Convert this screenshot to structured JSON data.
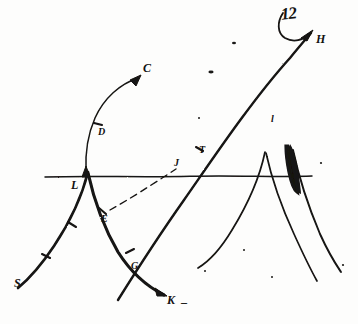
{
  "figure": {
    "kind": "hand-drawn-sketch",
    "medium": "black ink on white paper",
    "background_color": "#fdfdfc",
    "ink_color": "#141312",
    "width": 358,
    "height": 324
  },
  "annotations": {
    "top_right_note": "12"
  },
  "labels": [
    {
      "id": "C",
      "text": "C",
      "x": 143,
      "y": 62,
      "size": "lbl-md",
      "note": "terminus of upward arrow from left branch"
    },
    {
      "id": "H",
      "text": "H",
      "x": 316,
      "y": 33,
      "size": "lbl-md",
      "note": "terminus of long rising ray, upper right"
    },
    {
      "id": "D",
      "text": "D",
      "x": 98,
      "y": 127,
      "size": "lbl-sm",
      "note": "tick/label on ascending left branch"
    },
    {
      "id": "T",
      "text": "T",
      "x": 199,
      "y": 145,
      "size": "lbl-sm",
      "note": "mark above the crossing point"
    },
    {
      "id": "J",
      "text": "J",
      "x": 174,
      "y": 158,
      "size": "lbl-sm",
      "note": "mark at the line crossing on the datum"
    },
    {
      "id": "L",
      "text": "L",
      "x": 71,
      "y": 179,
      "size": "lbl-md",
      "note": "cusp apex on the horizontal datum line"
    },
    {
      "id": "l",
      "text": "l",
      "x": 271,
      "y": 114,
      "size": "lbl-sm",
      "note": "small stroke right of centre"
    },
    {
      "id": "E",
      "text": "E",
      "x": 101,
      "y": 214,
      "size": "lbl-sm",
      "note": "foot of the dashed connector"
    },
    {
      "id": "G",
      "text": "G",
      "x": 131,
      "y": 261,
      "size": "lbl-sm",
      "note": "label on descending main curve"
    },
    {
      "id": "S",
      "text": "S",
      "x": 14,
      "y": 277,
      "size": "lbl-md",
      "note": "lower-left terminus of the caustic curve"
    },
    {
      "id": "K",
      "text": "K",
      "x": 167,
      "y": 294,
      "size": "lbl-md",
      "note": "lower terminus, arrowhead points to it"
    },
    {
      "id": "Kdash",
      "text": "_",
      "x": 181,
      "y": 294,
      "size": "lbl-md",
      "note": "short dash following K"
    }
  ],
  "curves": [
    {
      "name": "datum-line",
      "role": "horizontal reference axis",
      "from": [
        45,
        177
      ],
      "to": [
        312,
        176
      ]
    },
    {
      "name": "left-caustic-lower",
      "role": "cusp branch descending to S",
      "from": [
        88,
        172
      ],
      "to": [
        18,
        288
      ]
    },
    {
      "name": "left-caustic-main",
      "role": "cusp branch descending to K",
      "from": [
        88,
        172
      ],
      "to": [
        165,
        295
      ]
    },
    {
      "name": "left-branch-upper",
      "role": "thin branch rising to arrow at C",
      "from": [
        86,
        172
      ],
      "to": [
        140,
        76
      ]
    },
    {
      "name": "long-rising-ray",
      "role": "ray from lower-left to H",
      "from": [
        118,
        300
      ],
      "to": [
        312,
        31
      ]
    },
    {
      "name": "dashed-connector",
      "role": "dashed line E to crossing",
      "from": [
        108,
        211
      ],
      "to": [
        176,
        168
      ]
    },
    {
      "name": "right-cusp-left",
      "role": "right cusp left branch",
      "from": [
        265,
        152
      ],
      "to": [
        198,
        268
      ]
    },
    {
      "name": "right-cusp-right",
      "role": "right cusp right branch",
      "from": [
        265,
        152
      ],
      "to": [
        317,
        281
      ]
    },
    {
      "name": "right-shaded-branch",
      "role": "heavily inked branch",
      "from": [
        292,
        148
      ],
      "to": [
        340,
        272
      ]
    }
  ],
  "marks": {
    "arrowheads": [
      {
        "on": "left-branch-upper",
        "at": [
          138,
          79
        ],
        "points_to": "C"
      },
      {
        "on": "left-caustic-main",
        "at": [
          163,
          292
        ],
        "points_to": "K"
      },
      {
        "on": "cusp-apex",
        "at": [
          86,
          172
        ],
        "points_to": "L"
      },
      {
        "on": "long-rising-ray",
        "at": [
          310,
          33
        ],
        "points_to": "H"
      }
    ],
    "ticks_on_curves": 6,
    "ink_specks": 7,
    "shaded_blob": {
      "at": [
        291,
        150
      ],
      "role": "dense ink shading on right branch"
    }
  }
}
